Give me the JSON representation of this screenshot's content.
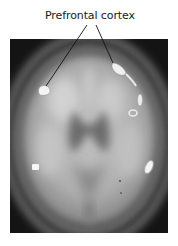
{
  "figure": {
    "label": "Prefrontal cortex",
    "image_description": "Axial grayscale brain scan with highlighted activation regions",
    "colors": {
      "background": "#ffffff",
      "scan_background": "#141414",
      "skull_ring": "#8a8a8a",
      "brain_tissue": "#b8b8b8",
      "activation": "#f4f4f4",
      "pointer_line": "#111111",
      "label_text": "#1a1a1a"
    },
    "pointers": [
      {
        "name": "left-pointer",
        "from": [
          87,
          25
        ],
        "to": [
          46,
          85
        ]
      },
      {
        "name": "right-pointer",
        "from": [
          96,
          25
        ],
        "to": [
          113,
          63
        ]
      }
    ],
    "activation_regions": [
      {
        "name": "left-frontal-spot",
        "cx": 44,
        "cy": 91
      },
      {
        "name": "right-frontal-spot",
        "cx": 120,
        "cy": 72
      },
      {
        "name": "right-lateral-spot",
        "cx": 140,
        "cy": 100
      },
      {
        "name": "right-mid-spot",
        "cx": 133,
        "cy": 113
      },
      {
        "name": "left-posterior-spot",
        "cx": 35,
        "cy": 167
      },
      {
        "name": "right-posterior-spot",
        "cx": 149,
        "cy": 167
      }
    ]
  }
}
